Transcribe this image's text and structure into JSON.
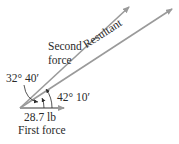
{
  "diagram": {
    "type": "vector-force-diagram",
    "colors": {
      "arrow": "#9a9a9a",
      "text": "#2a2a2a",
      "angle_arc": "#2a2a2a"
    },
    "vectors": [
      {
        "id": "first-force",
        "label": "First force",
        "magnitude_label": "28.7 lb"
      },
      {
        "id": "second-force",
        "label_line1": "Second",
        "label_line2": "force"
      },
      {
        "id": "resultant",
        "label": "Resultant"
      }
    ],
    "angles": [
      {
        "id": "first-to-resultant",
        "label": "32° 40′"
      },
      {
        "id": "first-to-second",
        "label": "42° 10′"
      }
    ]
  }
}
